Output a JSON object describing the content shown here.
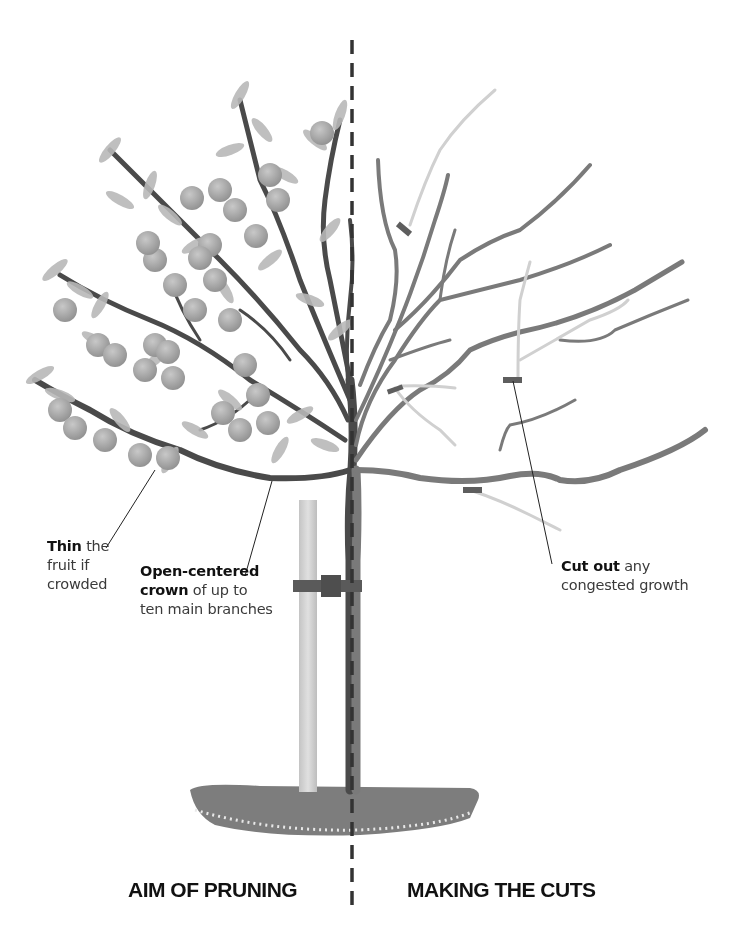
{
  "header": {
    "running_head": "PEACHES AND NECTARINES"
  },
  "left_panel": {
    "caption": "AIM OF PRUNING",
    "annotations": [
      {
        "bold": "Thin",
        "rest_line1": " the",
        "line2": "fruit if",
        "line3": "crowded"
      },
      {
        "bold": "Open-centered",
        "bold2": "crown",
        "rest_line2": " of up to",
        "line3": "ten main branches"
      }
    ]
  },
  "right_panel": {
    "caption": "MAKING THE CUTS",
    "annotations": [
      {
        "bold": "Cut out",
        "rest_line1": " any",
        "line2": "congested growth"
      }
    ]
  },
  "colors": {
    "trunk": "#4a4a4a",
    "branch_right": "#7a7a7a",
    "removed_branch": "#cfcfcf",
    "foliage": "#b5b5b5",
    "fruit": "#a9a9a9",
    "stake": "#d4d4d4",
    "tie": "#555555",
    "soil": "#7d7d7d",
    "divider": "#333333"
  }
}
